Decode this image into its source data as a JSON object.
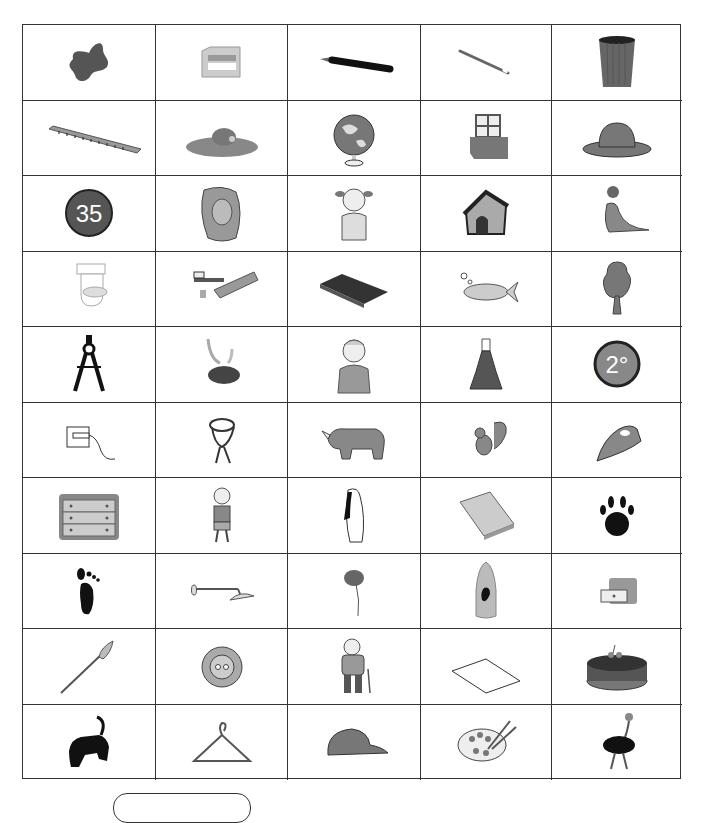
{
  "worksheet": {
    "grid": {
      "columns": 5,
      "rows": 10,
      "items": [
        {
          "name": "stain",
          "icon": "stain-icon"
        },
        {
          "name": "sharpener",
          "icon": "sharpener-icon"
        },
        {
          "name": "pencil",
          "icon": "pencil-icon"
        },
        {
          "name": "needle",
          "icon": "needle-icon"
        },
        {
          "name": "bin",
          "icon": "bin-icon"
        },
        {
          "name": "ruler",
          "icon": "ruler-icon"
        },
        {
          "name": "mole",
          "icon": "mole-icon"
        },
        {
          "name": "globe",
          "icon": "globe-icon"
        },
        {
          "name": "window box",
          "icon": "window-box-icon"
        },
        {
          "name": "hat",
          "icon": "hat-icon"
        },
        {
          "name": "35",
          "icon": "number-35-icon"
        },
        {
          "name": "lion",
          "icon": "lion-icon"
        },
        {
          "name": "girl",
          "icon": "girl-icon"
        },
        {
          "name": "kennel",
          "icon": "kennel-icon"
        },
        {
          "name": "seal",
          "icon": "seal-icon"
        },
        {
          "name": "toilet",
          "icon": "toilet-icon"
        },
        {
          "name": "toothbrush and toothpaste",
          "icon": "toothpaste-icon"
        },
        {
          "name": "book",
          "icon": "book-icon"
        },
        {
          "name": "fish",
          "icon": "fish-icon"
        },
        {
          "name": "tree",
          "icon": "tree-icon"
        },
        {
          "name": "compass",
          "icon": "compass-icon"
        },
        {
          "name": "smoke",
          "icon": "smoke-icon"
        },
        {
          "name": "man",
          "icon": "man-icon"
        },
        {
          "name": "dress",
          "icon": "dress-icon"
        },
        {
          "name": "2 degrees",
          "icon": "degrees-icon"
        },
        {
          "name": "plug",
          "icon": "plug-icon"
        },
        {
          "name": "scarf",
          "icon": "scarf-icon"
        },
        {
          "name": "rhinoceros",
          "icon": "rhino-icon"
        },
        {
          "name": "squirrel",
          "icon": "squirrel-icon"
        },
        {
          "name": "iron",
          "icon": "iron-icon"
        },
        {
          "name": "chest of drawers",
          "icon": "drawers-icon"
        },
        {
          "name": "boy",
          "icon": "boy-icon"
        },
        {
          "name": "penguin",
          "icon": "penguin-icon"
        },
        {
          "name": "notebook",
          "icon": "notebook-icon"
        },
        {
          "name": "paw print",
          "icon": "paw-icon"
        },
        {
          "name": "footprint",
          "icon": "footprint-icon"
        },
        {
          "name": "shower",
          "icon": "shower-icon"
        },
        {
          "name": "poppy",
          "icon": "poppy-icon"
        },
        {
          "name": "shampoo",
          "icon": "shampoo-icon"
        },
        {
          "name": "drawer",
          "icon": "drawer-icon"
        },
        {
          "name": "paintbrush",
          "icon": "paintbrush-icon"
        },
        {
          "name": "button",
          "icon": "button-icon"
        },
        {
          "name": "grandfather",
          "icon": "grandfather-icon"
        },
        {
          "name": "paper",
          "icon": "paper-icon"
        },
        {
          "name": "cake",
          "icon": "cake-icon"
        },
        {
          "name": "panther",
          "icon": "panther-icon"
        },
        {
          "name": "hanger",
          "icon": "hanger-icon"
        },
        {
          "name": "cap",
          "icon": "cap-icon"
        },
        {
          "name": "palette",
          "icon": "palette-icon"
        },
        {
          "name": "ostrich",
          "icon": "ostrich-icon"
        }
      ],
      "text_in_icons": {
        "number_35": "35",
        "degrees": "2°"
      }
    },
    "answer_box": {
      "text": ""
    }
  }
}
